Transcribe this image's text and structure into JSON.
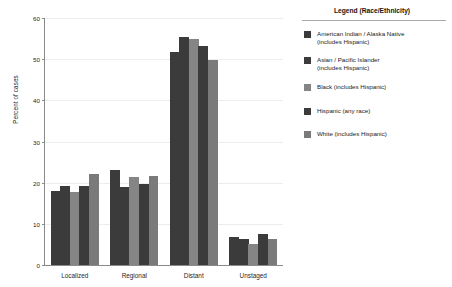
{
  "chart_data": {
    "type": "bar",
    "title": "",
    "xlabel": "",
    "ylabel": "Percent of cases",
    "categories": [
      "Localized",
      "Regional",
      "Distant",
      "Unstaged"
    ],
    "ylim": [
      0,
      60
    ],
    "yticks": [
      0,
      10,
      20,
      30,
      40,
      50,
      60
    ],
    "grid": true,
    "legend_position": "right",
    "legend_title": "Legend (Race/Ethnicity)",
    "series": [
      {
        "name": "American Indian / Alaska Native (includes Hispanic)",
        "legend_label": "American Indian / Alaska Native\n(includes Hispanic)",
        "color": "#3b3b3b",
        "values": [
          18.0,
          23.0,
          51.7,
          6.8
        ]
      },
      {
        "name": "Asian / Pacific Islander (includes Hispanic)",
        "legend_label": "Asian / Pacific Islander\n(includes Hispanic)",
        "color": "#3b3b3b",
        "values": [
          19.1,
          19.0,
          55.3,
          6.4
        ]
      },
      {
        "name": "Black (includes Hispanic)",
        "legend_label": "Black (includes Hispanic)",
        "color": "#858585",
        "values": [
          17.8,
          21.5,
          55.0,
          5.2
        ]
      },
      {
        "name": "Hispanic (any race)",
        "legend_label": "Hispanic (any race)",
        "color": "#3b3b3b",
        "values": [
          19.2,
          19.7,
          53.2,
          7.6
        ]
      },
      {
        "name": "White (includes Hispanic)",
        "legend_label": "White (includes Hispanic)",
        "color": "#7a7a7a",
        "values": [
          22.2,
          21.6,
          49.7,
          6.3
        ]
      }
    ]
  },
  "axis": {
    "ylabel": "Percent of cases"
  },
  "legend": {
    "title": "Legend (Race/Ethnicity)"
  }
}
